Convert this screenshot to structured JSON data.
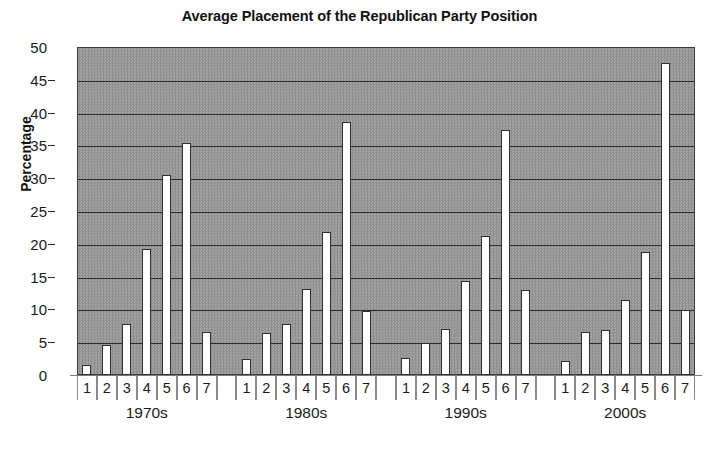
{
  "chart_data": {
    "type": "bar",
    "title": "Average Placement of the Republican Party Position",
    "xlabel": "",
    "ylabel": "Percentage",
    "ylim": [
      0,
      50
    ],
    "ytick_step": 5,
    "yticks": [
      0,
      5,
      10,
      15,
      20,
      25,
      30,
      35,
      40,
      45,
      50
    ],
    "ytick_labels": [
      "0",
      "5",
      "10",
      "15",
      "20",
      "25",
      "30",
      "35",
      "40",
      "45",
      "50"
    ],
    "grid": true,
    "legend": "none",
    "position_labels": [
      "1",
      "2",
      "3",
      "4",
      "5",
      "6",
      "7"
    ],
    "categories": [
      "1970s",
      "1980s",
      "1990s",
      "2000s"
    ],
    "groups": [
      {
        "name": "1970s",
        "positions": [
          "1",
          "2",
          "3",
          "4",
          "5",
          "6",
          "7"
        ],
        "values": [
          1.5,
          4.5,
          7.8,
          19.2,
          30.5,
          35.3,
          6.5
        ]
      },
      {
        "name": "1980s",
        "positions": [
          "1",
          "2",
          "3",
          "4",
          "5",
          "6",
          "7"
        ],
        "values": [
          2.5,
          6.4,
          7.8,
          13.1,
          21.8,
          38.5,
          9.7
        ]
      },
      {
        "name": "1990s",
        "positions": [
          "1",
          "2",
          "3",
          "4",
          "5",
          "6",
          "7"
        ],
        "values": [
          2.6,
          4.9,
          7.0,
          14.4,
          21.2,
          37.3,
          12.9
        ]
      },
      {
        "name": "2000s",
        "positions": [
          "1",
          "2",
          "3",
          "4",
          "5",
          "6",
          "7"
        ],
        "values": [
          2.2,
          6.5,
          6.8,
          11.5,
          18.7,
          47.5,
          9.9
        ]
      }
    ],
    "colors": {
      "bar_fill": "#ffffff",
      "bar_outline": "#2f2f2f",
      "plot_background": "#969696",
      "gridline": "#2b2b2b",
      "text": "#1a1a1a"
    }
  }
}
